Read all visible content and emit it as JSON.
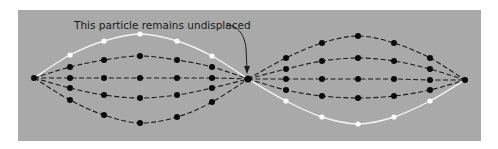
{
  "annotation": {
    "text": "This particle remains undisplaced"
  },
  "colors": {
    "background": "#a9a9a9",
    "dashed": "#1a1a1a",
    "highlight": "#f4f4f4",
    "node": "#0a0a0a"
  },
  "endpoints": {
    "left": [
      34,
      78
    ],
    "middle": [
      248,
      79
    ],
    "right": [
      465,
      80
    ]
  },
  "curves": {
    "left": [
      {
        "style": "solid-white",
        "points": [
          [
            70,
            55
          ],
          [
            104,
            41
          ],
          [
            140,
            34
          ],
          [
            177,
            41
          ],
          [
            212,
            56
          ]
        ]
      },
      {
        "style": "dashed",
        "points": [
          [
            70,
            67
          ],
          [
            104,
            60
          ],
          [
            140,
            56
          ],
          [
            177,
            60
          ],
          [
            212,
            67
          ]
        ]
      },
      {
        "style": "dashed",
        "points": [
          [
            70,
            78
          ],
          [
            104,
            78
          ],
          [
            140,
            78
          ],
          [
            177,
            78
          ],
          [
            212,
            78
          ]
        ]
      },
      {
        "style": "dashed",
        "points": [
          [
            70,
            88
          ],
          [
            104,
            95
          ],
          [
            140,
            98
          ],
          [
            177,
            95
          ],
          [
            212,
            88
          ]
        ]
      },
      {
        "style": "dashed",
        "points": [
          [
            70,
            100
          ],
          [
            104,
            115
          ],
          [
            140,
            123
          ],
          [
            177,
            117
          ],
          [
            212,
            102
          ]
        ]
      }
    ],
    "right": [
      {
        "style": "dashed",
        "points": [
          [
            286,
            58
          ],
          [
            322,
            43
          ],
          [
            358,
            36
          ],
          [
            394,
            43
          ],
          [
            430,
            58
          ]
        ]
      },
      {
        "style": "dashed",
        "points": [
          [
            286,
            69
          ],
          [
            322,
            61
          ],
          [
            358,
            58
          ],
          [
            394,
            61
          ],
          [
            430,
            69
          ]
        ]
      },
      {
        "style": "dashed",
        "points": [
          [
            286,
            79
          ],
          [
            322,
            79
          ],
          [
            358,
            79
          ],
          [
            394,
            79
          ],
          [
            430,
            80
          ]
        ]
      },
      {
        "style": "dashed",
        "points": [
          [
            286,
            90
          ],
          [
            322,
            96
          ],
          [
            358,
            98
          ],
          [
            394,
            96
          ],
          [
            430,
            90
          ]
        ]
      },
      {
        "style": "solid-white",
        "points": [
          [
            286,
            101
          ],
          [
            322,
            117
          ],
          [
            358,
            124
          ],
          [
            394,
            117
          ],
          [
            430,
            101
          ]
        ]
      }
    ]
  }
}
